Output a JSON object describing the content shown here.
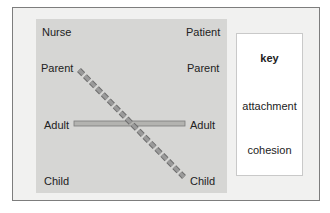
{
  "diagram": {
    "left_column": {
      "header": "Nurse",
      "states": [
        "Parent",
        "Adult",
        "Child"
      ]
    },
    "right_column": {
      "header": "Patient",
      "states": [
        "Parent",
        "Adult",
        "Child"
      ]
    },
    "connections": [
      {
        "from": "Nurse Parent",
        "to": "Patient Child",
        "type": "attachment"
      },
      {
        "from": "Nurse Adult",
        "to": "Patient Adult",
        "type": "cohesion"
      }
    ],
    "key": {
      "title": "key",
      "items": [
        {
          "label": "attachment",
          "style": "dashed"
        },
        {
          "label": "cohesion",
          "style": "solid-bar"
        }
      ]
    },
    "colors": {
      "panel": "#d6d6d4",
      "frame": "#f1f1f0",
      "line_fill": "#9a9a9a",
      "bar_fill": "#b3b3b0"
    }
  }
}
